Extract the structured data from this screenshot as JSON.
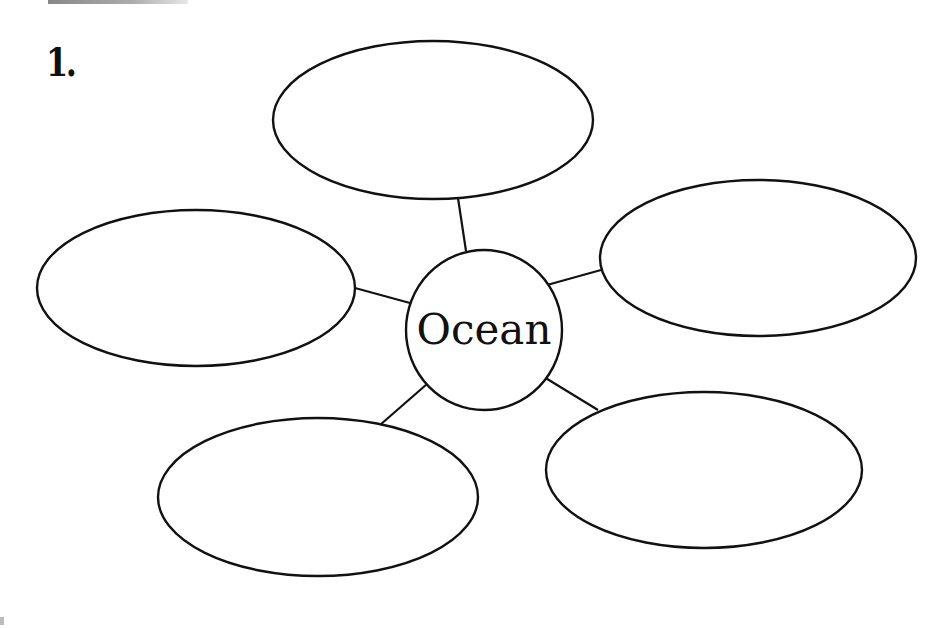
{
  "worksheet": {
    "item_number": "1.",
    "diagram_type": "bubble map / web",
    "center": {
      "label": "Ocean"
    },
    "bubbles": [
      {
        "position": "top",
        "label": ""
      },
      {
        "position": "right",
        "label": ""
      },
      {
        "position": "bottom-right",
        "label": ""
      },
      {
        "position": "bottom-left",
        "label": ""
      },
      {
        "position": "left",
        "label": ""
      }
    ],
    "colors": {
      "stroke": "#111111",
      "fill": "#ffffff",
      "background": "#ffffff"
    }
  }
}
